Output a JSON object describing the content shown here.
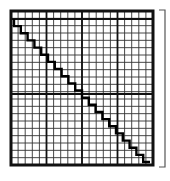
{
  "diagram": {
    "title": "",
    "colors": {
      "background": "#ffffff",
      "grid_minor": "#333333",
      "grid_major": "#111111",
      "staircase": "#000000",
      "bracket": "#555555"
    },
    "grid": {
      "left": 11,
      "top": 11,
      "right": 153,
      "bottom": 165,
      "minor_columns": 20,
      "minor_rows": 21,
      "major_column_lines_x": [
        11,
        46.5,
        82,
        117.5,
        153
      ],
      "major_row_lines_y": [
        11,
        19,
        94,
        165
      ]
    },
    "staircase": {
      "start": [
        14,
        19
      ],
      "end": [
        150,
        162
      ],
      "steps": 20
    },
    "bracket": {
      "x": 165,
      "top": 10,
      "bottom": 167,
      "tick_length": 6
    }
  }
}
